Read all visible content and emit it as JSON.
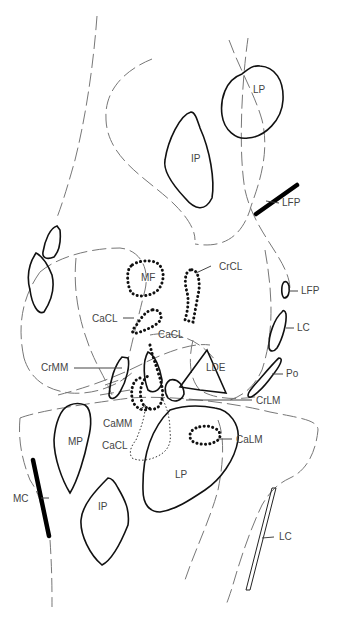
{
  "diagram": {
    "kind": "anatomical-schematic",
    "labels": {
      "lp_top": "LP",
      "ip_top": "IP",
      "lfp_top": "LFP",
      "mf": "MF",
      "crcl": "CrCL",
      "cacl_left": "CaCL",
      "cacl_mid": "CaCL",
      "lfp_mid": "LFP",
      "lc_mid": "LC",
      "crmm": "CrMM",
      "lde": "LDE",
      "po": "Po",
      "crlm": "CrLM",
      "camm": "CaMM",
      "cacl_lower": "CaCL",
      "calm": "CaLM",
      "mp": "MP",
      "lp_bottom": "LP",
      "mc": "MC",
      "ip_bottom": "IP",
      "lc_bottom": "LC"
    },
    "legend_styles": {
      "solid_outline": "attachment area",
      "thick_line": "collateral / femoropatellar ligament",
      "dotted_outline": "ligament / meniscal attachment",
      "dashed_line": "bone contour"
    },
    "colors": {
      "ink": "#111111",
      "contour": "#777777",
      "label": "#444444",
      "background": "#ffffff"
    }
  }
}
